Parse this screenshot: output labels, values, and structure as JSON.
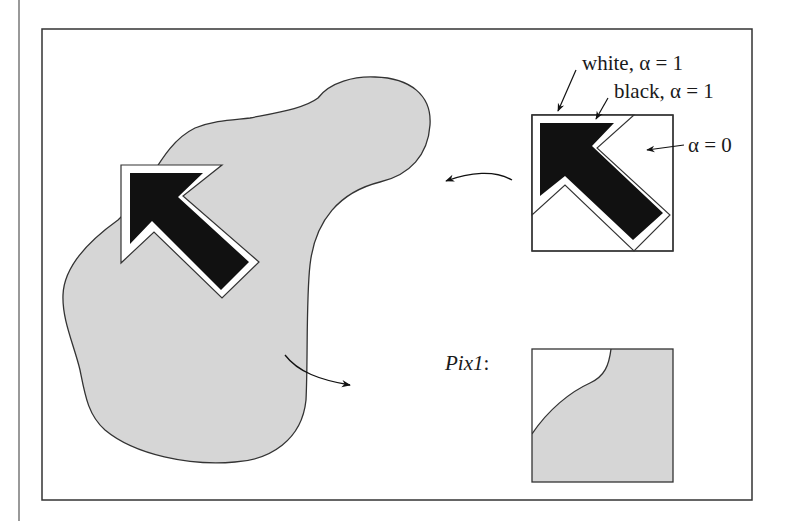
{
  "figure": {
    "labels": {
      "white_label": "white, α = 1",
      "black_label": "black, α = 1",
      "alpha_zero_label": "α = 0",
      "pix1_label": "Pix1",
      "pix1_colon": ":"
    },
    "colors": {
      "frame": "#333333",
      "blob_fill": "#d6d6d6",
      "arrow_fill": "#111111",
      "outline_fill": "#ffffff"
    },
    "elements": {
      "blob": "gray blob region (destination image)",
      "cursor_composited": "cursor arrow composited onto blob",
      "cursor_icon": "cursor icon with alpha mask",
      "pix1": "saved background pixmap Pix1"
    }
  }
}
